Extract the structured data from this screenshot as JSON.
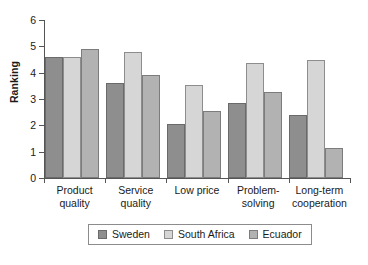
{
  "chart_data": {
    "type": "bar",
    "title": "",
    "xlabel": "",
    "ylabel": "Ranking",
    "ylim": [
      0,
      6
    ],
    "yticks": [
      0,
      1,
      2,
      3,
      4,
      5,
      6
    ],
    "ytick_labels": [
      "0",
      "1",
      "2",
      "3",
      "4",
      "5",
      "6"
    ],
    "grid": false,
    "legend_position": "bottom",
    "categories": [
      "Product\nquality",
      "Service\nquality",
      "Low price",
      "Problem-\nsolving",
      "Long-term\ncooperation"
    ],
    "series": [
      {
        "name": "Sweden",
        "color": "#8e8e8e",
        "values": [
          4.6,
          3.6,
          2.05,
          2.85,
          2.4
        ]
      },
      {
        "name": "South Africa",
        "color": "#d6d6d6",
        "values": [
          4.6,
          4.8,
          3.55,
          4.35,
          4.5
        ]
      },
      {
        "name": "Ecuador",
        "color": "#b2b2b2",
        "values": [
          4.9,
          3.9,
          2.55,
          3.25,
          1.15
        ]
      }
    ]
  }
}
